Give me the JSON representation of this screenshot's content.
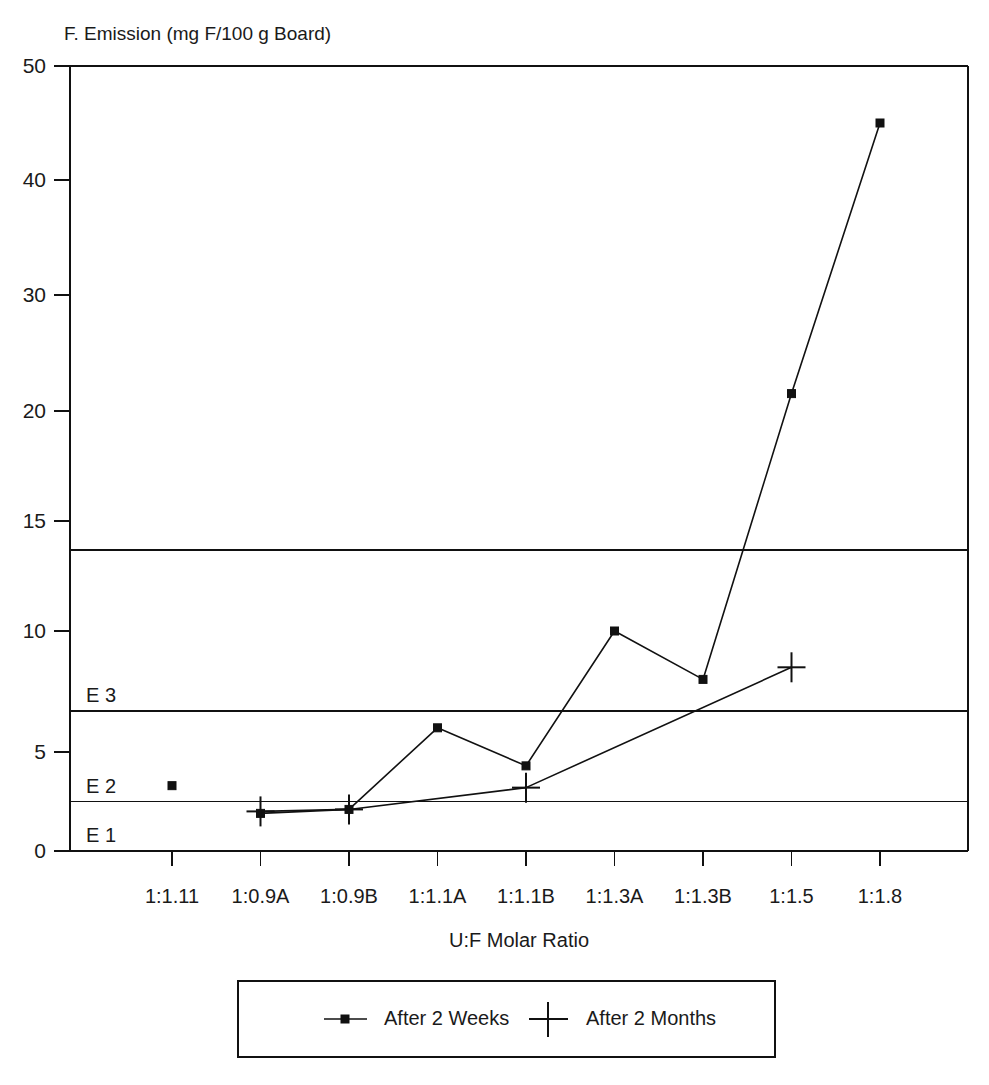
{
  "chart_data": {
    "type": "line",
    "title": "F. Emission (mg F/100 g Board)",
    "xlabel": "U:F Molar Ratio",
    "ylabel": "F. Emission (mg F/100 g Board)",
    "categories": [
      "1:1.11",
      "1:0.9A",
      "1:0.9B",
      "1:1.1A",
      "1:1.1B",
      "1:1.3A",
      "1:1.3B",
      "1:1.5",
      "1:1.8"
    ],
    "ytick_labels": [
      "0",
      "5",
      "10",
      "15",
      "20",
      "30",
      "40",
      "50"
    ],
    "ytick_values": [
      0,
      5,
      10,
      15,
      20,
      30,
      40,
      50
    ],
    "ylim": [
      0,
      50
    ],
    "axis_note": "non-linear y axis: compressed above 20",
    "grid": false,
    "legend_position": "bottom",
    "series": [
      {
        "name": "After 2 Weeks",
        "marker": "filled-square-dot",
        "values": [
          3.3,
          1.9,
          2.1,
          6.0,
          4.3,
          10.0,
          8.0,
          21.5,
          45.0
        ],
        "connected_from_index": 1,
        "isolated_points": [
          {
            "category": "1:1.11",
            "value": 3.3
          }
        ]
      },
      {
        "name": "After 2 Months",
        "marker": "plus",
        "values": [
          null,
          2.0,
          2.1,
          null,
          3.2,
          null,
          null,
          8.5,
          null
        ],
        "connected_from_index": 1,
        "connected_to_index": 7
      }
    ],
    "reference_lines": [
      {
        "label": "E 1",
        "value": 0.0,
        "label_position": "above-line"
      },
      {
        "label": "E 2",
        "value": 2.5,
        "label_position": "above-line"
      },
      {
        "label": "E 3",
        "value": 6.7,
        "label_position": "above-line"
      },
      {
        "label": "",
        "value": 13.7,
        "label_position": "none"
      }
    ]
  },
  "legend": {
    "entries": [
      {
        "label": "After 2 Weeks",
        "marker": "dot"
      },
      {
        "label": "After 2 Months",
        "marker": "plus"
      }
    ]
  }
}
